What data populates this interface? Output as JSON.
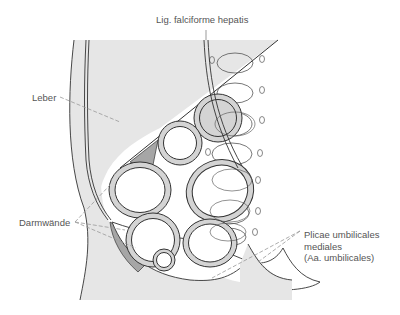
{
  "figure": {
    "labels": {
      "lig_falciforme": "Lig. falciforme hepatis",
      "leber": "Leber",
      "darmwaende": "Darmwände",
      "plicae": [
        "Plicae umbilicales",
        "mediales",
        "(Aa. umbilicales)"
      ]
    },
    "colors": {
      "liver_fill": "#e6e6e6",
      "tissue_fill": "#e6e6e6",
      "dark_fill": "#a6a6a6",
      "ring_fill": "#d4d4d4",
      "line": "#333333",
      "leader": "#999999",
      "text": "#555555"
    }
  }
}
